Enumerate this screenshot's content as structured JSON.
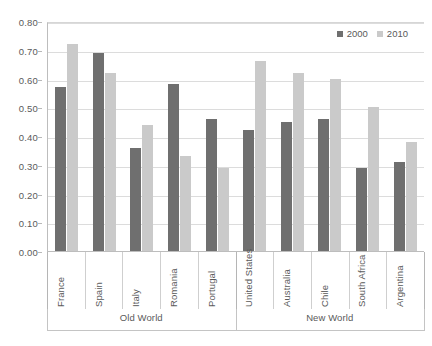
{
  "chart_data": {
    "type": "bar",
    "title": "",
    "xlabel": "",
    "ylabel": "",
    "ylim": [
      0.0,
      0.8
    ],
    "grid": true,
    "legend_position": "top-right",
    "categories": [
      "France",
      "Spain",
      "Italy",
      "Romania",
      "Portugal",
      "United States",
      "Australia",
      "Chile",
      "South Africa",
      "Argentina"
    ],
    "groups": [
      {
        "label": "Old World",
        "categories": [
          "France",
          "Spain",
          "Italy",
          "Romania",
          "Portugal"
        ]
      },
      {
        "label": "New World",
        "categories": [
          "United States",
          "Australia",
          "Chile",
          "South Africa",
          "Argentina"
        ]
      }
    ],
    "series": [
      {
        "name": "2000",
        "color": "#6f6f6f",
        "values": [
          0.57,
          0.69,
          0.36,
          0.58,
          0.46,
          0.42,
          0.45,
          0.46,
          0.29,
          0.31
        ]
      },
      {
        "name": "2010",
        "color": "#cacaca",
        "values": [
          0.72,
          0.62,
          0.44,
          0.33,
          0.29,
          0.66,
          0.62,
          0.6,
          0.5,
          0.38
        ]
      }
    ],
    "yticks": [
      "0.00",
      "0.10",
      "0.20",
      "0.30",
      "0.40",
      "0.50",
      "0.60",
      "0.70",
      "0.80"
    ],
    "ytick_values": [
      0.0,
      0.1,
      0.2,
      0.3,
      0.4,
      0.5,
      0.6,
      0.7,
      0.8
    ]
  },
  "legend": {
    "items": [
      {
        "label": "2000",
        "color": "#6f6f6f"
      },
      {
        "label": "2010",
        "color": "#cacaca"
      }
    ]
  }
}
